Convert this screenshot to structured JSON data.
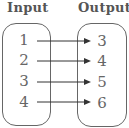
{
  "headers": {
    "input": "Input",
    "output": "Output"
  },
  "mapping": [
    {
      "input": "1",
      "output": "3"
    },
    {
      "input": "2",
      "output": "4"
    },
    {
      "input": "3",
      "output": "5"
    },
    {
      "input": "4",
      "output": "6"
    }
  ],
  "colors": {
    "line": "#333333",
    "text": "#666666",
    "border": "#666666"
  }
}
